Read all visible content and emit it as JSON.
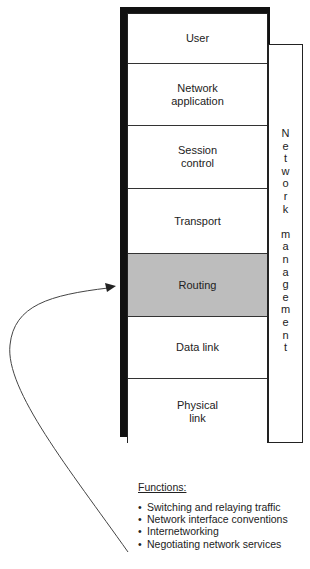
{
  "stack": {
    "layers": [
      {
        "label": "User",
        "top": 0,
        "height": 50,
        "shaded": false
      },
      {
        "label": "Network\napplication",
        "top": 50,
        "height": 62,
        "shaded": false
      },
      {
        "label": "Session\ncontrol",
        "top": 112,
        "height": 63,
        "shaded": false
      },
      {
        "label": "Transport",
        "top": 175,
        "height": 65,
        "shaded": false
      },
      {
        "label": "Routing",
        "top": 240,
        "height": 63,
        "shaded": true
      },
      {
        "label": "Data link",
        "top": 303,
        "height": 62,
        "shaded": false
      },
      {
        "label": "Physical\nlink",
        "top": 365,
        "height": 65,
        "shaded": false
      }
    ]
  },
  "network_management": {
    "label": "Network management",
    "letters": [
      "N",
      "e",
      "t",
      "w",
      "o",
      "r",
      "k",
      "",
      "m",
      "a",
      "n",
      "a",
      "g",
      "e",
      "m",
      "e",
      "n",
      "t"
    ]
  },
  "functions": {
    "title": "Functions:",
    "items": [
      "Switching and relaying traffic",
      "Network interface conventions",
      "Internetworking",
      "Negotiating network services"
    ]
  },
  "colors": {
    "shaded_layer": "#bdbdbd",
    "border": "#222222",
    "shadow": "#111111"
  }
}
